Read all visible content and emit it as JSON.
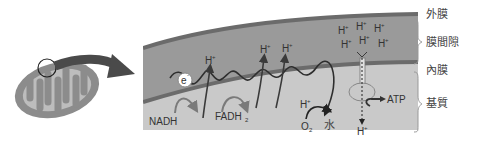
{
  "diagram": {
    "type": "mitochondrial-electron-transport-chain",
    "colors": {
      "background": "#ffffff",
      "outer_membrane": "#6b6b6b",
      "intermembrane_space": "#9a9a9a",
      "inner_membrane": "#6b6b6b",
      "matrix": "#c9c9c9",
      "arrow": "#4a4a4a",
      "electron_path": "#2e2e2e",
      "text": "#333333"
    },
    "region_labels": {
      "outer_membrane": "外膜",
      "intermembrane_space": "膜間隙",
      "inner_membrane": "內膜",
      "matrix": "基質"
    },
    "electron_label": "e",
    "electron_superscript": "-",
    "proton_label": "H",
    "proton_superscript": "+",
    "substrates": {
      "nadh": "NADH",
      "fadh2_base": "FADH",
      "fadh2_sub": "2"
    },
    "oxygen": {
      "base": "O",
      "sub": "2"
    },
    "water": "水",
    "atp": "ATP"
  }
}
